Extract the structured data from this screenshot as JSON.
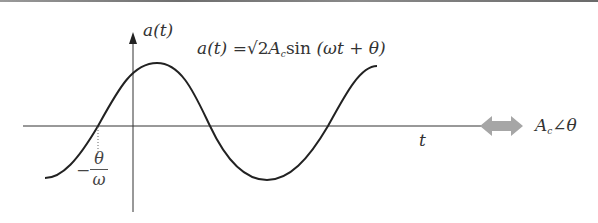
{
  "figure": {
    "y_axis_label": "a(t)",
    "x_axis_label": "t",
    "formula": {
      "lhs": "a(t)",
      "eq": "=",
      "sqrt": "√2",
      "amp": "A",
      "amp_sub": "c",
      "fn": "sin",
      "arg": "(ωt + θ)"
    },
    "phase_marker": {
      "sign": "−",
      "numerator": "θ",
      "denominator": "ω"
    },
    "equivalence_arrow": "double-arrow",
    "phasor": {
      "amp": "A",
      "amp_sub": "c",
      "angle_symbol": "∠",
      "angle": "θ"
    },
    "colors": {
      "curve": "#222222",
      "axes": "#333333",
      "arrow": "#a6a6a6",
      "text": "#333333",
      "top_rule": "#7a7a7a"
    }
  }
}
